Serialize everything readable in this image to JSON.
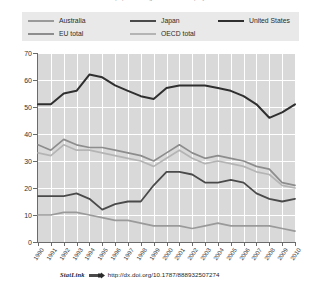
{
  "figure": {
    "title_partial": "Share of population aged 55-64 in employment",
    "statlink_label": "StatLink",
    "statlink_url": "http://dx.doi.org/10.1787/888932507274",
    "statlink_icon": "statlink-chain-icon"
  },
  "legend": {
    "position": "top",
    "entries": [
      {
        "label": "Australia",
        "color": "#9a9a9a"
      },
      {
        "label": "Japan",
        "color": "#4a4a4a"
      },
      {
        "label": "United States",
        "color": "#2f2f2f"
      },
      {
        "label": "EU total",
        "color": "#8d8d8d"
      },
      {
        "label": "OECD total",
        "color": "#b4b4b4"
      }
    ]
  },
  "chart_data": {
    "type": "line",
    "title": "Share of population aged 55-64 in employment",
    "xlabel": "",
    "ylabel": "",
    "xlim": [
      1990,
      2010
    ],
    "ylim": [
      0,
      70
    ],
    "ytick_step": 10,
    "grid": true,
    "legend_position": "top",
    "x": [
      1990,
      1991,
      1992,
      1993,
      1994,
      1995,
      1996,
      1997,
      1998,
      1999,
      2000,
      2001,
      2002,
      2003,
      2004,
      2005,
      2006,
      2007,
      2008,
      2009,
      2010
    ],
    "ytick_labels": [
      "0",
      "10",
      "20",
      "30",
      "40",
      "50",
      "60",
      "70"
    ],
    "xtick_labels": [
      "1990",
      "1991",
      "1992",
      "1993",
      "1994",
      "1995",
      "1996",
      "1997",
      "1998",
      "1999",
      "2000",
      "2001",
      "2002",
      "2003",
      "2004",
      "2005",
      "2006",
      "2007",
      "2008",
      "2009",
      "2010"
    ],
    "series": [
      {
        "name": "United States",
        "color": "#2f2f2f",
        "width": 2.0,
        "values": [
          51,
          51,
          55,
          56,
          62,
          61,
          58,
          56,
          54,
          53,
          57,
          58,
          58,
          58,
          57,
          56,
          54,
          51,
          46,
          48,
          51
        ]
      },
      {
        "name": "EU total",
        "color": "#8d8d8d",
        "width": 1.7,
        "values": [
          36,
          34,
          38,
          36,
          35,
          35,
          34,
          33,
          32,
          30,
          33,
          36,
          33,
          31,
          32,
          31,
          30,
          28,
          27,
          22,
          21
        ]
      },
      {
        "name": "OECD total",
        "color": "#b4b4b4",
        "width": 1.7,
        "values": [
          33,
          32,
          36,
          34,
          34,
          33,
          32,
          31,
          30,
          28,
          31,
          34,
          31,
          29,
          30,
          29,
          28,
          26,
          25,
          21,
          20
        ]
      },
      {
        "name": "Japan",
        "color": "#4a4a4a",
        "width": 1.8,
        "values": [
          17,
          17,
          17,
          18,
          16,
          12,
          14,
          15,
          15,
          21,
          26,
          26,
          25,
          22,
          22,
          23,
          22,
          18,
          16,
          15,
          16
        ]
      },
      {
        "name": "Australia",
        "color": "#9a9a9a",
        "width": 1.7,
        "values": [
          10,
          10,
          11,
          11,
          10,
          9,
          8,
          8,
          7,
          6,
          6,
          6,
          5,
          6,
          7,
          6,
          6,
          6,
          6,
          5,
          4
        ]
      }
    ]
  }
}
